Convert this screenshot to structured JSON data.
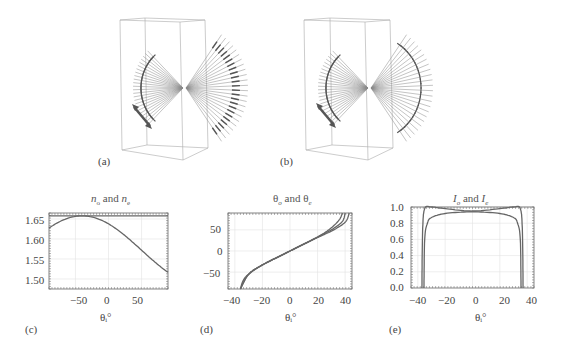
{
  "figure": {
    "panels": [
      {
        "id": "a",
        "label": "(a)",
        "type": "3d-ray-diagram",
        "description": "Refracted rays fanning through a birefringent crystal box with polarization arrows; incident polarization double arrow at lower left"
      },
      {
        "id": "b",
        "label": "(b)",
        "type": "3d-ray-diagram",
        "description": "Refracted rays fanning through a birefringent crystal box with polarization arrows (alternate orientation); incident polarization double arrow at lower left"
      }
    ]
  },
  "charts": {
    "c": {
      "label": "(c)",
      "title_parts": [
        "n",
        "o",
        " and ",
        "n",
        "e"
      ],
      "xlabel": "θᵢ°",
      "yticks": [
        "1.65",
        "1.60",
        "1.55",
        "1.50"
      ],
      "xticks": [
        "−50",
        "0",
        "50"
      ]
    },
    "d": {
      "label": "(d)",
      "title_parts": [
        "θ",
        "o",
        " and ",
        "θ",
        "e"
      ],
      "xlabel": "θᵢ°",
      "yticks": [
        "50",
        "0",
        "−50"
      ],
      "xticks": [
        "−40",
        "−20",
        "0",
        "20",
        "40"
      ]
    },
    "e": {
      "label": "(e)",
      "title_parts": [
        "I",
        "o",
        " and ",
        "I",
        "e"
      ],
      "xlabel": "θᵢ°",
      "yticks": [
        "1.0",
        "0.8",
        "0.6",
        "0.4",
        "0.2",
        "0.0"
      ],
      "xticks": [
        "−40",
        "−20",
        "0",
        "20",
        "40"
      ]
    }
  },
  "chart_data": [
    {
      "panel": "c",
      "type": "line",
      "title": "n_o and n_e",
      "xlabel": "θ_i°",
      "ylabel": "",
      "xlim": [
        -90,
        90
      ],
      "ylim": [
        1.475,
        1.665
      ],
      "grid": true,
      "series": [
        {
          "name": "n_o",
          "x": [
            -90,
            0,
            90
          ],
          "values": [
            1.658,
            1.658,
            1.658
          ]
        },
        {
          "name": "n_e",
          "x": [
            -90,
            -70,
            -40,
            -20,
            0,
            20,
            50,
            70,
            90
          ],
          "values": [
            1.555,
            1.615,
            1.658,
            1.64,
            1.58,
            1.52,
            1.486,
            1.505,
            1.555
          ]
        }
      ]
    },
    {
      "panel": "d",
      "type": "line",
      "title": "θ_o and θ_e",
      "xlabel": "θ_i°",
      "ylabel": "",
      "xlim": [
        -45,
        45
      ],
      "ylim": [
        -90,
        90
      ],
      "grid": true,
      "series": [
        {
          "name": "θ_o",
          "x": [
            -36,
            -34,
            -30,
            -20,
            0,
            20,
            30,
            36,
            38
          ],
          "values": [
            -90,
            -70,
            -55,
            -33,
            0,
            33,
            55,
            75,
            90
          ]
        },
        {
          "name": "θ_e (1)",
          "x": [
            -36,
            -30,
            -20,
            0,
            20,
            30,
            38,
            40
          ],
          "values": [
            -90,
            -55,
            -33,
            0,
            33,
            50,
            70,
            90
          ]
        },
        {
          "name": "θ_e (2)",
          "x": [
            -36,
            -30,
            -20,
            0,
            20,
            30,
            40,
            43
          ],
          "values": [
            -90,
            -55,
            -33,
            0,
            32,
            47,
            68,
            90
          ]
        }
      ]
    },
    {
      "panel": "e",
      "type": "line",
      "title": "I_o and I_e",
      "xlabel": "θ_i°",
      "ylabel": "",
      "xlim": [
        -45,
        45
      ],
      "ylim": [
        0,
        1
      ],
      "grid": true,
      "series": [
        {
          "name": "I_o",
          "x": [
            -35.5,
            -35,
            -33,
            -30,
            -20,
            0,
            20,
            30,
            33,
            35,
            35.5
          ],
          "values": [
            0,
            0.6,
            0.8,
            0.87,
            0.92,
            0.94,
            0.92,
            0.87,
            0.8,
            0.6,
            0
          ]
        },
        {
          "name": "I_e",
          "x": [
            -37,
            -36.5,
            -35,
            -30,
            -20,
            0,
            20,
            30,
            35,
            36.5,
            37
          ],
          "values": [
            0,
            0.7,
            0.98,
            1.0,
            0.98,
            0.95,
            0.98,
            1.0,
            0.98,
            0.7,
            0
          ]
        }
      ]
    }
  ]
}
